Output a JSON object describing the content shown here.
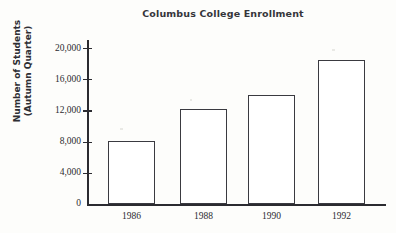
{
  "chart_data": {
    "type": "bar",
    "title": "Columbus College Enrollment",
    "xlabel": "",
    "ylabel_lines": [
      "Number of Students",
      "(Autumn Quarter)"
    ],
    "ylabel": "Number of Students (Autumn Quarter)",
    "categories": [
      "1986",
      "1988",
      "1990",
      "1992"
    ],
    "values": [
      8100,
      12200,
      14100,
      18600
    ],
    "ylim": [
      0,
      21000
    ],
    "yticks": [
      0,
      4000,
      8000,
      12000,
      16000,
      20000
    ],
    "ytick_labels": [
      "0",
      "4,000",
      "8,000",
      "12,000",
      "16,000",
      "20,000"
    ],
    "grid": false,
    "legend": false,
    "bar_fill_color": "#ffffff",
    "bar_edge_color": "#3a3a40",
    "axis_color": "#2b2b30",
    "background_color": "#fdfdfb"
  }
}
